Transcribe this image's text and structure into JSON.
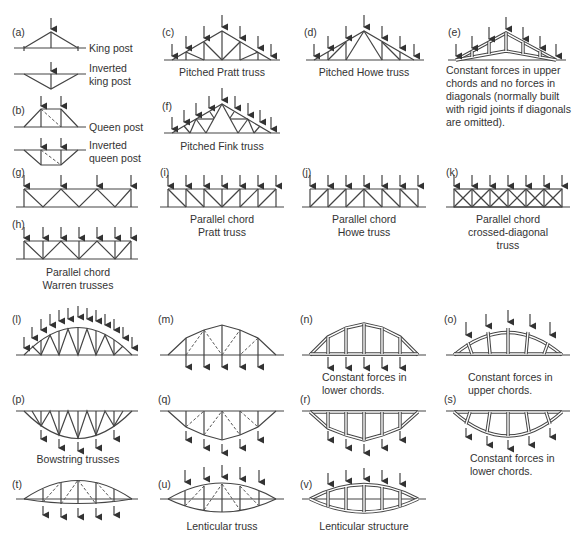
{
  "figure": {
    "panels": [
      {
        "id": "a",
        "tag": "(a)",
        "labels": [
          "King post",
          "Inverted king post"
        ]
      },
      {
        "id": "b",
        "tag": "(b)",
        "labels": [
          "Queen post",
          "Inverted queen post"
        ]
      },
      {
        "id": "c",
        "tag": "(c)",
        "caption": "Pitched Pratt truss"
      },
      {
        "id": "d",
        "tag": "(d)",
        "caption": "Pitched Howe truss"
      },
      {
        "id": "e",
        "tag": "(e)",
        "caption_lines": [
          "Constant forces in upper",
          "chords and no forces in",
          "diagonals (normally built",
          "with rigid joints if diagonals",
          "are omitted)."
        ]
      },
      {
        "id": "f",
        "tag": "(f)",
        "caption": "Pitched Fink truss"
      },
      {
        "id": "g",
        "tag": "(g)"
      },
      {
        "id": "h",
        "tag": "(h)",
        "caption_lines": [
          "Parallel chord",
          "Warren trusses"
        ]
      },
      {
        "id": "i",
        "tag": "(i)",
        "caption_lines": [
          "Parallel chord",
          "Pratt truss"
        ]
      },
      {
        "id": "j",
        "tag": "(j)",
        "caption_lines": [
          "Parallel chord",
          "Howe truss"
        ]
      },
      {
        "id": "k",
        "tag": "(k)",
        "caption_lines": [
          "Parallel chord",
          "crossed-diagonal",
          "truss"
        ]
      },
      {
        "id": "l",
        "tag": "(l)"
      },
      {
        "id": "m",
        "tag": "(m)"
      },
      {
        "id": "n",
        "tag": "(n)",
        "caption_lines": [
          "Constant forces in",
          "lower chords."
        ]
      },
      {
        "id": "o",
        "tag": "(o)",
        "caption_lines": [
          "Constant forces in",
          "upper chords."
        ]
      },
      {
        "id": "p",
        "tag": "(p)",
        "caption": "Bowstring trusses"
      },
      {
        "id": "q",
        "tag": "(q)"
      },
      {
        "id": "r",
        "tag": "(r)"
      },
      {
        "id": "s",
        "tag": "(s)",
        "caption_lines": [
          "Constant forces in",
          "lower chords."
        ]
      },
      {
        "id": "t",
        "tag": "(t)"
      },
      {
        "id": "u",
        "tag": "(u)",
        "caption": "Lenticular truss"
      },
      {
        "id": "v",
        "tag": "(v)",
        "caption": "Lenticular structure"
      }
    ]
  }
}
